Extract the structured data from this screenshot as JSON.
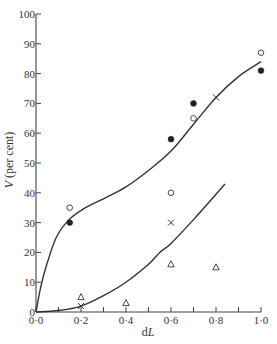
{
  "chart_data": {
    "type": "scatter",
    "title": "",
    "xlabel": "dL",
    "ylabel": "V (per cent)",
    "xlim": [
      0,
      1.0
    ],
    "ylim": [
      0,
      100
    ],
    "x_ticks": [
      0,
      0.1,
      0.2,
      0.3,
      0.4,
      0.5,
      0.6,
      0.7,
      0.8,
      0.9,
      1.0
    ],
    "x_tick_labels": [
      {
        "value": 0.0,
        "label": "0·0"
      },
      {
        "value": 0.2,
        "label": "0·2"
      },
      {
        "value": 0.4,
        "label": "0·4"
      },
      {
        "value": 0.6,
        "label": "0·6"
      },
      {
        "value": 0.8,
        "label": "0·8"
      },
      {
        "value": 1.0,
        "label": "1·0"
      }
    ],
    "y_tick_labels": [
      {
        "value": 0,
        "label": "0"
      },
      {
        "value": 10,
        "label": "10"
      },
      {
        "value": 20,
        "label": "20"
      },
      {
        "value": 30,
        "label": "30"
      },
      {
        "value": 40,
        "label": "40"
      },
      {
        "value": 50,
        "label": "50"
      },
      {
        "value": 60,
        "label": "60"
      },
      {
        "value": 70,
        "label": "70"
      },
      {
        "value": 80,
        "label": "80"
      },
      {
        "value": 90,
        "label": "90"
      },
      {
        "value": 100,
        "label": "100"
      }
    ],
    "grid": false,
    "legend": "none",
    "series": [
      {
        "name": "filled-circles",
        "marker": "filled-circle",
        "points": [
          [
            0.15,
            30
          ],
          [
            0.6,
            58
          ],
          [
            0.7,
            70
          ],
          [
            1.0,
            81
          ]
        ]
      },
      {
        "name": "open-circles",
        "marker": "open-circle",
        "points": [
          [
            0.15,
            35
          ],
          [
            0.6,
            40
          ],
          [
            0.7,
            65
          ],
          [
            1.0,
            87
          ]
        ]
      },
      {
        "name": "crosses",
        "marker": "cross",
        "points": [
          [
            0.2,
            2
          ],
          [
            0.6,
            30
          ],
          [
            0.8,
            72
          ]
        ]
      },
      {
        "name": "triangles",
        "marker": "open-triangle",
        "points": [
          [
            0.2,
            5
          ],
          [
            0.4,
            3
          ],
          [
            0.6,
            16
          ],
          [
            0.8,
            15
          ]
        ]
      }
    ],
    "curves": [
      {
        "name": "upper-fitted-curve",
        "points": [
          [
            0,
            0
          ],
          [
            0.02,
            8
          ],
          [
            0.044,
            15
          ],
          [
            0.09,
            25
          ],
          [
            0.147,
            31
          ],
          [
            0.22,
            35
          ],
          [
            0.3,
            38
          ],
          [
            0.4,
            42
          ],
          [
            0.5,
            47.5
          ],
          [
            0.6,
            54
          ],
          [
            0.7,
            63
          ],
          [
            0.8,
            72
          ],
          [
            0.9,
            79
          ],
          [
            1.0,
            84
          ]
        ]
      },
      {
        "name": "lower-fitted-curve",
        "points": [
          [
            0,
            0
          ],
          [
            0.1,
            0.5
          ],
          [
            0.2,
            2
          ],
          [
            0.3,
            5.5
          ],
          [
            0.4,
            10
          ],
          [
            0.5,
            16
          ],
          [
            0.55,
            20
          ],
          [
            0.6,
            23
          ],
          [
            0.7,
            31
          ],
          [
            0.8,
            39.5
          ],
          [
            0.84,
            43
          ]
        ]
      }
    ]
  }
}
